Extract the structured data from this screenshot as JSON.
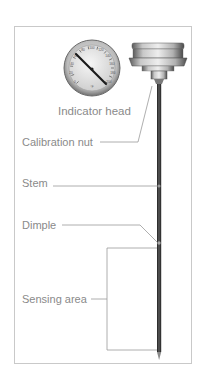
{
  "diagram": {
    "labels": {
      "indicator_head": "Indicator head",
      "calibration_nut": "Calibration nut",
      "stem": "Stem",
      "dimple": "Dimple",
      "sensing_area": "Sensing area"
    },
    "dial": {
      "tick_numbers": [
        "0",
        "20",
        "40",
        "60",
        "80",
        "100",
        "120",
        "140",
        "160",
        "180",
        "200",
        "220"
      ]
    },
    "colors": {
      "frame": "#c9c9c9",
      "label_text": "#8a8a8a",
      "leader_line": "#9a9a9a",
      "stem": "#3a3a3a",
      "dial_face": "#e8e8e8",
      "dial_rim": "#8f8f8f"
    }
  }
}
